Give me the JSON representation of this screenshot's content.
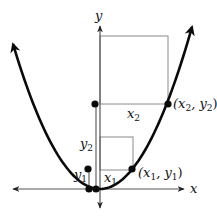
{
  "canvas": {
    "width": 217,
    "height": 218,
    "background": "#ffffff"
  },
  "colors": {
    "curve": "#0a0a0a",
    "axis": "#555555",
    "guide": "#8a8a8a",
    "dot": "#0a0a0a",
    "text": "#111111"
  },
  "axes": {
    "origin": [
      100,
      189
    ],
    "x_axis": {
      "from": [
        13,
        189
      ],
      "to": [
        184,
        189
      ],
      "label": "x",
      "label_pos": [
        190,
        193
      ]
    },
    "y_axis": {
      "from": [
        100,
        208
      ],
      "to": [
        100,
        26
      ],
      "label": "y",
      "label_pos": [
        95,
        20
      ]
    }
  },
  "curve": {
    "type": "parabola",
    "vertex": [
      100,
      189
    ],
    "left_tip": [
      13,
      50
    ],
    "right_tip": [
      192,
      27
    ]
  },
  "points": [
    {
      "name": "point-x1-y1",
      "pos": [
        132,
        169
      ],
      "label": "(x",
      "sub1": "1",
      "mid": ", y",
      "sub2": "1",
      "end": ")",
      "label_pos": [
        138,
        177
      ]
    },
    {
      "name": "point-x2-y2",
      "pos": [
        168,
        104
      ],
      "label": "(x",
      "sub1": "2",
      "mid": ", y",
      "sub2": "2",
      "end": ")",
      "label_pos": [
        173,
        108
      ]
    },
    {
      "name": "dot-y2-height",
      "pos": [
        95,
        104
      ]
    },
    {
      "name": "dot-y1-height",
      "pos": [
        88,
        169
      ]
    },
    {
      "name": "dot-y1-base",
      "pos": [
        89,
        189
      ]
    },
    {
      "name": "dot-y2-base",
      "pos": [
        96,
        189
      ]
    }
  ],
  "rects": [
    {
      "name": "square-x2",
      "x": 100,
      "y": 36,
      "w": 68,
      "h": 68
    },
    {
      "name": "square-x1",
      "x": 100,
      "y": 137,
      "w": 33,
      "h": 33
    }
  ],
  "guides": [
    {
      "name": "y2-height-line",
      "from": [
        96,
        104
      ],
      "to": [
        96,
        189
      ]
    },
    {
      "name": "y1-height-line",
      "from": [
        89,
        169
      ],
      "to": [
        89,
        189
      ]
    }
  ],
  "labels": [
    {
      "name": "label-x2",
      "text": "x",
      "sub": "2",
      "pos": [
        127,
        118
      ]
    },
    {
      "name": "label-y2",
      "text": "y",
      "sub": "2",
      "pos": [
        80,
        148
      ]
    },
    {
      "name": "label-x1",
      "text": "x",
      "sub": "1",
      "pos": [
        104,
        182
      ]
    },
    {
      "name": "label-y1",
      "text": "y",
      "sub": "1",
      "pos": [
        74,
        179
      ]
    }
  ]
}
